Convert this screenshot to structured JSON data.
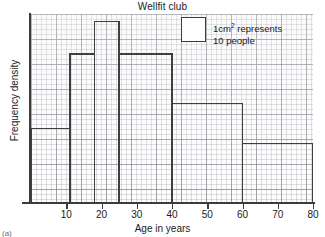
{
  "chart_data": {
    "type": "bar",
    "title": "Wellfit club",
    "xlabel": "Age in years",
    "ylabel": "Frequency density",
    "grid": true,
    "legend_position": "inside-top-right",
    "xlim": [
      0,
      80
    ],
    "ylim": [
      0,
      7.6
    ],
    "xticks": [
      10,
      20,
      30,
      40,
      50,
      60,
      70,
      80
    ],
    "xtick_labels": [
      "10",
      "20",
      "30",
      "40",
      "50",
      "60",
      "70",
      "80"
    ],
    "yticks": [],
    "ytick_labels": [],
    "bin_edges": [
      0,
      11,
      18,
      25,
      40,
      60,
      80
    ],
    "bins": [
      {
        "label": "0-11",
        "x0": 0,
        "x1": 11,
        "frequency_density": 3.0
      },
      {
        "label": "11-18",
        "x0": 11,
        "x1": 18,
        "frequency_density": 6.0
      },
      {
        "label": "18-25",
        "x0": 18,
        "x1": 25,
        "frequency_density": 7.3
      },
      {
        "label": "25-40",
        "x0": 25,
        "x1": 40,
        "frequency_density": 6.0
      },
      {
        "label": "40-60",
        "x0": 40,
        "x1": 60,
        "frequency_density": 4.0
      },
      {
        "label": "60-80",
        "x0": 60,
        "x1": 80,
        "frequency_density": 2.4
      }
    ],
    "values": [
      3.0,
      6.0,
      7.3,
      6.0,
      4.0,
      2.4
    ],
    "categories": [
      "0-11",
      "11-18",
      "18-25",
      "25-40",
      "40-60",
      "60-80"
    ],
    "annotations": [
      "1cm2 represents 10 people"
    ]
  },
  "legend": {
    "line1_prefix": "1cm",
    "line1_sup": "2",
    "line1_suffix": " represents",
    "line2": "10 people"
  },
  "marks": {
    "corner": "(a)"
  }
}
